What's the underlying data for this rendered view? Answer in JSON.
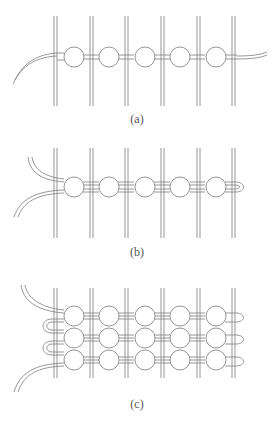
{
  "figure": {
    "panels": [
      {
        "id": "a",
        "label": "(a)",
        "rows": 1,
        "beads_per_row": 5,
        "bars": 6
      },
      {
        "id": "b",
        "label": "(b)",
        "rows": 1,
        "beads_per_row": 5,
        "bars": 6
      },
      {
        "id": "c",
        "label": "(c)",
        "rows": 3,
        "beads_per_row": 5,
        "bars": 6
      }
    ],
    "colors": {
      "stroke": "#8a8a8a",
      "background": "#ffffff",
      "bead_fill": "#ffffff"
    }
  }
}
